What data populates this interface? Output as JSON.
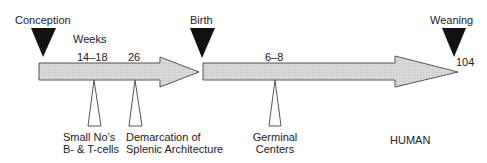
{
  "diagram": {
    "species_label": "HUMAN",
    "units_label": "Weeks",
    "milestones": [
      {
        "label": "Conception"
      },
      {
        "label": "Birth"
      },
      {
        "label": "Weaning"
      }
    ],
    "ticks": [
      {
        "label": "14–18"
      },
      {
        "label": "26"
      },
      {
        "label": "6–8"
      },
      {
        "label": "104"
      }
    ],
    "events": [
      {
        "line1": "Small No’s",
        "line2": "B- & T-cells"
      },
      {
        "line1": "Demarcation of",
        "line2": "Splenic Architecture"
      },
      {
        "line1": "Germinal",
        "line2": "Centers"
      }
    ],
    "colors": {
      "arrow_fill": "#d4d4d4",
      "arrow_stroke": "#555555",
      "milestone_marker": "#111111",
      "event_marker_stroke": "#555555"
    }
  }
}
